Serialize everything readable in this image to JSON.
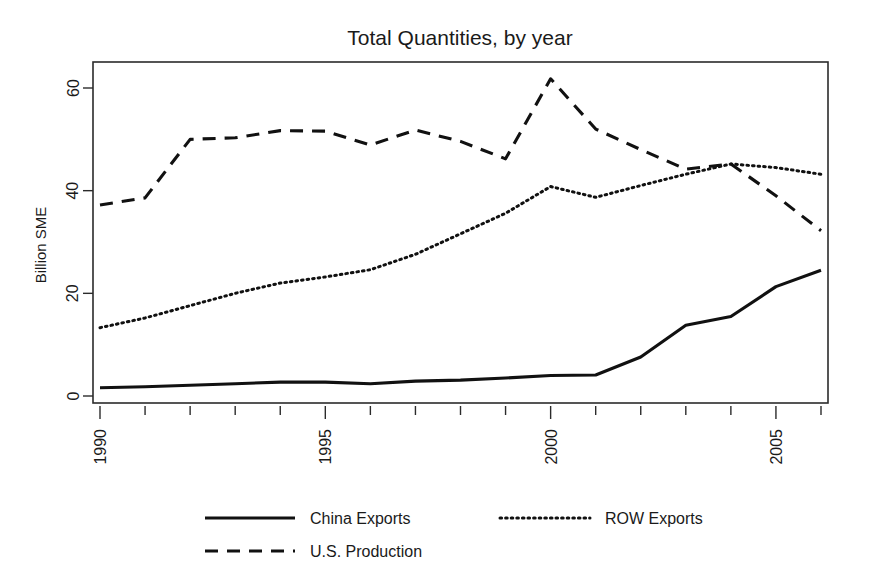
{
  "chart_data": {
    "type": "line",
    "title": "Total Quantities, by year",
    "xlabel": "",
    "ylabel": "Billion SME",
    "xlim": [
      1990,
      2006
    ],
    "ylim": [
      0,
      65
    ],
    "grid": false,
    "legend_position": "bottom",
    "x": [
      1990,
      1991,
      1992,
      1993,
      1994,
      1995,
      1996,
      1997,
      1998,
      1999,
      2000,
      2001,
      2002,
      2003,
      2004,
      2005,
      2006
    ],
    "xticks": [
      1990,
      1995,
      2000,
      2005
    ],
    "xtick_labels": [
      "1990",
      "1995",
      "2000",
      "2005"
    ],
    "yticks": [
      0,
      20,
      40,
      60
    ],
    "ytick_labels": [
      "0",
      "20",
      "40",
      "60"
    ],
    "series": [
      {
        "name": "China Exports",
        "style": "solid",
        "values": [
          1.6,
          1.8,
          2.1,
          2.4,
          2.7,
          2.7,
          2.4,
          2.9,
          3.1,
          3.5,
          4.0,
          4.1,
          7.6,
          13.8,
          15.5,
          21.3,
          24.5
        ]
      },
      {
        "name": "U.S. Production",
        "style": "dashed",
        "values": [
          37.2,
          38.6,
          50.0,
          50.3,
          51.7,
          51.6,
          48.9,
          51.8,
          49.6,
          46.2,
          61.8,
          52.0,
          48.0,
          44.2,
          45.2,
          39.0,
          32.2
        ]
      },
      {
        "name": "ROW Exports",
        "style": "dotted",
        "values": [
          13.3,
          15.2,
          17.6,
          20.0,
          22.0,
          23.2,
          24.6,
          27.6,
          31.6,
          35.6,
          40.8,
          38.7,
          41.0,
          43.2,
          45.2,
          44.5,
          43.2
        ]
      }
    ]
  },
  "legend": {
    "entries": [
      {
        "label": "China Exports",
        "style": "solid"
      },
      {
        "label": "ROW Exports",
        "style": "dotted"
      },
      {
        "label": "U.S. Production",
        "style": "dashed"
      }
    ]
  }
}
